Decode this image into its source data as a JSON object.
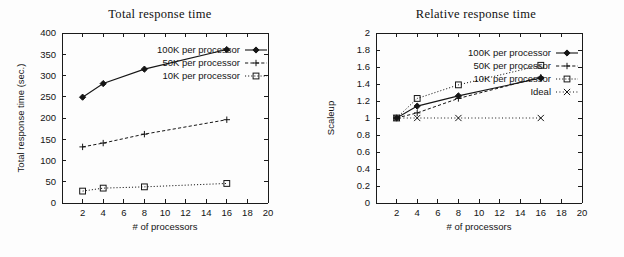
{
  "chart_data": [
    {
      "id": "total-response-time",
      "type": "line",
      "title": "Total response time",
      "xlabel": "# of processors",
      "ylabel": "Total response time (sec.)",
      "xlim": [
        0,
        20
      ],
      "ylim": [
        0,
        400
      ],
      "xticks": [
        2,
        4,
        6,
        8,
        10,
        12,
        14,
        16,
        18,
        20
      ],
      "xticklabels": [
        "2",
        "4",
        "6",
        "8",
        "10",
        "12",
        "14",
        "16",
        "18",
        "20"
      ],
      "yticks": [
        0,
        50,
        100,
        150,
        200,
        250,
        300,
        350,
        400
      ],
      "yticklabels": [
        "0",
        "50",
        "100",
        "150",
        "200",
        "250",
        "300",
        "350",
        "400"
      ],
      "grid": false,
      "legend_position": "upper right inside",
      "x": [
        2,
        4,
        8,
        16
      ],
      "series": [
        {
          "name": "100K per processor",
          "values": [
            249,
            281,
            315,
            361
          ],
          "linestyle": "solid",
          "marker": "diamond-filled",
          "color": "#151515"
        },
        {
          "name": "50K per processor",
          "values": [
            132,
            141,
            162,
            196
          ],
          "linestyle": "dashed",
          "marker": "plus",
          "color": "#151515"
        },
        {
          "name": "10K per processor",
          "values": [
            28,
            35,
            38,
            46
          ],
          "linestyle": "dotted",
          "marker": "square-open",
          "color": "#151515"
        }
      ]
    },
    {
      "id": "relative-response-time",
      "type": "line",
      "title": "Relative response time",
      "xlabel": "# of processors",
      "ylabel": "Scaleup",
      "xlim": [
        0,
        20
      ],
      "ylim": [
        0,
        2
      ],
      "xticks": [
        2,
        4,
        6,
        8,
        10,
        12,
        14,
        16,
        18,
        20
      ],
      "xticklabels": [
        "2",
        "4",
        "6",
        "8",
        "10",
        "12",
        "14",
        "16",
        "18",
        "20"
      ],
      "yticks": [
        0,
        0.2,
        0.4,
        0.6,
        0.8,
        1,
        1.2,
        1.4,
        1.6,
        1.8,
        2
      ],
      "yticklabels": [
        "0",
        "0.2",
        "0.4",
        "0.6",
        "0.8",
        "1",
        "1.2",
        "1.4",
        "1.6",
        "1.8",
        "2"
      ],
      "grid": false,
      "legend_position": "upper right inside",
      "x": [
        2,
        4,
        8,
        16
      ],
      "series": [
        {
          "name": "100K per processor",
          "values": [
            1.0,
            1.14,
            1.26,
            1.47
          ],
          "linestyle": "solid",
          "marker": "diamond-filled",
          "color": "#151515"
        },
        {
          "name": "50K per processor",
          "values": [
            1.0,
            1.06,
            1.23,
            1.48
          ],
          "linestyle": "dashed",
          "marker": "plus",
          "color": "#151515"
        },
        {
          "name": "10K per processor",
          "values": [
            1.0,
            1.23,
            1.39,
            1.62
          ],
          "linestyle": "dotted",
          "marker": "square-open",
          "color": "#151515"
        },
        {
          "name": "Ideal",
          "values": [
            1.0,
            1.0,
            1.0,
            1.0
          ],
          "linestyle": "dashdot",
          "marker": "cross",
          "color": "#151515"
        }
      ]
    }
  ]
}
